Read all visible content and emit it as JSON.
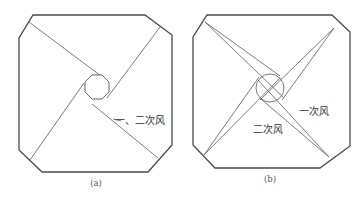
{
  "figure": {
    "panels": [
      {
        "id": "a",
        "caption": "(a)",
        "annotation": "一、二次风",
        "center_shape": "octagon",
        "description": "Tangential firing arrangement: four corner jets tangent to a small central octagon"
      },
      {
        "id": "b",
        "caption": "(b)",
        "annotations": [
          "一次风",
          "二次风"
        ],
        "center_shape": "circle",
        "description": "Primary and secondary air jets from four corners with offset angles around a central circle"
      }
    ],
    "colors": {
      "line": "#4a4a4a",
      "background": "#ffffff",
      "text": "#333333"
    }
  }
}
